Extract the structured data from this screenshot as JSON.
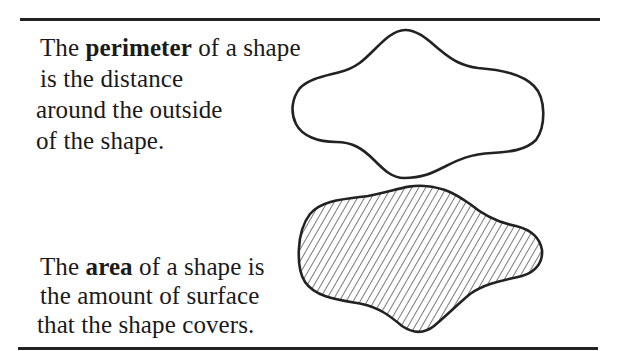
{
  "figure": {
    "perimeter_text": {
      "line1_pre": "The ",
      "line1_bold": "perimeter",
      "line1_post": " of a shape",
      "line2": "is the distance",
      "line3": "around the outside",
      "line4": "of the shape."
    },
    "area_text": {
      "line1_pre": "The ",
      "line1_bold": "area",
      "line1_post": " of a shape is",
      "line2": "the amount of surface",
      "line3": "that the shape covers."
    },
    "shapes": {
      "outline_shape": "perimeter-outline",
      "hatched_shape": "area-hatched-fill"
    },
    "colors": {
      "ink": "#222222",
      "background": "#ffffff"
    }
  }
}
